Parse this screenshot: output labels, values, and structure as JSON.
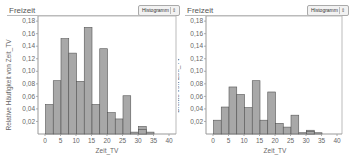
{
  "panels": [
    {
      "title": "Freizeit",
      "dropdown": {
        "selected": "Histogramm",
        "arrow": "⇕"
      },
      "ylabel": "Relative Häufigkeit von Zeit_TV",
      "xlabel": "Zeit_TV"
    },
    {
      "title": "Freizeit",
      "dropdown": {
        "selected": "Histogramm",
        "arrow": "⇕"
      },
      "ylabel": "Dichte von Zeit_TV",
      "xlabel": "Zeit_TV"
    }
  ],
  "chart_data": [
    {
      "type": "bar",
      "title": "Freizeit",
      "xlabel": "Zeit_TV",
      "ylabel": "Relative Häufigkeit von Zeit_TV",
      "bin_width": 2.5,
      "bins_start": [
        0,
        2.5,
        5,
        7.5,
        10,
        12.5,
        15,
        17.5,
        20,
        22.5,
        25,
        27.5,
        30,
        32.5
      ],
      "values": [
        0.047,
        0.085,
        0.152,
        0.129,
        0.084,
        0.17,
        0.047,
        0.136,
        0.034,
        0.024,
        0.061,
        0.003,
        0.012,
        0.0
      ],
      "extra_bins": [
        {
          "start": 30,
          "value": 0.007
        },
        {
          "start": 32.5,
          "value": 0.003
        }
      ],
      "xticks": [
        "0",
        "5",
        "10",
        "15",
        "20",
        "25",
        "30",
        "35",
        "40"
      ],
      "yticks": [
        "0,02",
        "0,04",
        "0,06",
        "0,08",
        "0,10",
        "0,12",
        "0,14",
        "0,16",
        "0,18"
      ],
      "xlim": [
        0,
        40
      ],
      "ylim": [
        0,
        0.185
      ],
      "grid": false
    },
    {
      "type": "bar",
      "title": "Freizeit",
      "xlabel": "Zeit_TV",
      "ylabel": "Dichte von Zeit_TV",
      "bin_width": 2.5,
      "values": [
        0.022,
        0.043,
        0.075,
        0.063,
        0.042,
        0.085,
        0.022,
        0.067,
        0.017,
        0.011,
        0.03,
        0.002,
        0.006,
        0.0
      ],
      "extra_bins": [
        {
          "start": 30,
          "value": 0.004
        },
        {
          "start": 32.5,
          "value": 0.002
        }
      ],
      "xticks": [
        "0",
        "5",
        "10",
        "15",
        "20",
        "25",
        "30",
        "35",
        "40"
      ],
      "yticks": [
        "0,02",
        "0,04",
        "0,06",
        "0,08",
        "0,10",
        "0,12",
        "0,14",
        "0,16",
        "0,18"
      ],
      "xlim": [
        0,
        40
      ],
      "ylim": [
        0,
        0.185
      ],
      "grid": false
    }
  ],
  "colors": {
    "bar_fill": "#a8a8a8",
    "bar_stroke": "#555555",
    "axis": "#999999"
  }
}
